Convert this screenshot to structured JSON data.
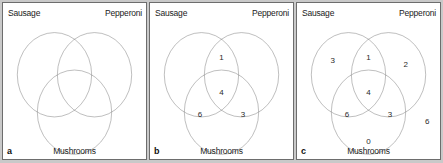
{
  "figure": {
    "background_color": "#c9c9c9",
    "panel_background": "#ffffff",
    "circle_stroke_color": "#6f6f6f",
    "border_color": "#6d6d6d"
  },
  "labels": {
    "sausage": "Sausage",
    "pepperoni": "Pepperoni",
    "mushrooms": "Mushrooms"
  },
  "panels": [
    {
      "letter": "a",
      "regions": []
    },
    {
      "letter": "b",
      "regions": [
        {
          "id": "sausage-pepperoni",
          "value": "1",
          "x": 50,
          "y": 35
        },
        {
          "id": "all-three",
          "value": "4",
          "x": 50,
          "y": 58
        },
        {
          "id": "sausage-mushrooms",
          "value": "6",
          "x": 35,
          "y": 72
        },
        {
          "id": "pepperoni-mushrooms",
          "value": "3",
          "x": 65,
          "y": 72
        }
      ]
    },
    {
      "letter": "c",
      "regions": [
        {
          "id": "sausage-only",
          "value": "3",
          "x": 25,
          "y": 37
        },
        {
          "id": "sausage-pepperoni",
          "value": "1",
          "x": 50,
          "y": 35
        },
        {
          "id": "pepperoni-only",
          "value": "2",
          "x": 76,
          "y": 40
        },
        {
          "id": "all-three",
          "value": "4",
          "x": 50,
          "y": 58
        },
        {
          "id": "sausage-mushrooms",
          "value": "6",
          "x": 35,
          "y": 72
        },
        {
          "id": "pepperoni-mushrooms",
          "value": "3",
          "x": 65,
          "y": 72
        },
        {
          "id": "mushrooms-only",
          "value": "0",
          "x": 50,
          "y": 89
        },
        {
          "id": "outside-all",
          "value": "6",
          "x": 91,
          "y": 76
        }
      ]
    }
  ],
  "geometry": {
    "circle_radius_pct": 26,
    "sausage_center": {
      "x": 36,
      "y": 46
    },
    "pepperoni_center": {
      "x": 64,
      "y": 46
    },
    "mushrooms_center": {
      "x": 50,
      "y": 70
    }
  }
}
